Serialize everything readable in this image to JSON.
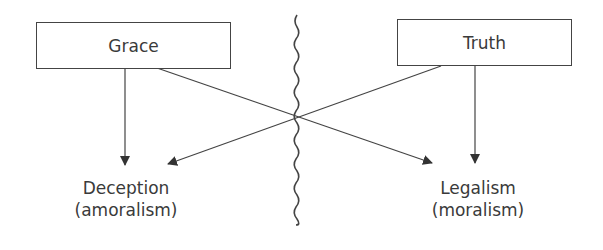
{
  "diagram": {
    "boxes": [
      {
        "id": "grace",
        "label": "Grace"
      },
      {
        "id": "truth",
        "label": "Truth"
      }
    ],
    "outcomes": [
      {
        "id": "deception",
        "line1": "Deception",
        "line2": "(amoralism)"
      },
      {
        "id": "legalism",
        "line1": "Legalism",
        "line2": "(moralism)"
      }
    ],
    "colors": {
      "stroke": "#444444",
      "text": "#3a3a3a",
      "background": "#ffffff"
    }
  }
}
